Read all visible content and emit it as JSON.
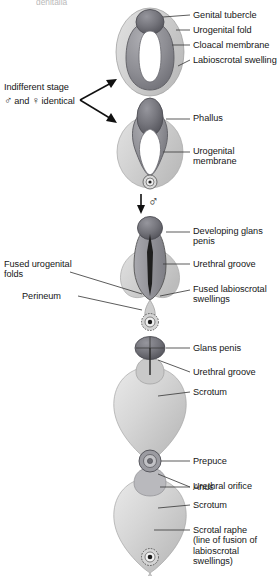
{
  "figure": {
    "title_cut_off": "genitalia",
    "type": "anatomical-development-diagram",
    "indifferent_note": {
      "line1": "Indifferent stage",
      "line2_pre": "",
      "male_symbol": "♂",
      "and": "and",
      "female_symbol": "♀",
      "line2_post": "identical",
      "line2_full": "♂ and ♀ identical"
    },
    "pathway_symbol": "♂",
    "colors": {
      "tubercle": "#6e6e76",
      "fold": "#8e8e93",
      "swelling": "#cfcfcf",
      "membrane": "#ffffff",
      "groove": "#2a2a2a",
      "outline": "#4a4a4a",
      "label_text": "#161616",
      "leader_line": "#4a4a4a"
    }
  },
  "stages": [
    {
      "id": "stage-1-indifferent",
      "name": "Indifferent stage",
      "labels": [
        {
          "key": "genital-tubercle",
          "text": "Genital tubercle",
          "side": "right"
        },
        {
          "key": "urogenital-fold",
          "text": "Urogenital fold",
          "side": "right"
        },
        {
          "key": "cloacal-membrane",
          "text": "Cloacal membrane",
          "side": "right"
        },
        {
          "key": "labioscrotal-swelling",
          "text": "Labioscrotal swelling",
          "side": "right"
        }
      ]
    },
    {
      "id": "stage-2-phallus",
      "name": "Early differentiation",
      "labels": [
        {
          "key": "phallus",
          "text": "Phallus",
          "side": "right"
        },
        {
          "key": "urogenital-membrane",
          "text": "Urogenital\nmembrane",
          "side": "right"
        }
      ]
    },
    {
      "id": "stage-3-developing-glans",
      "name": "Developing glans stage",
      "labels": [
        {
          "key": "developing-glans-penis",
          "text": "Developing glans\npenis",
          "side": "right"
        },
        {
          "key": "urethral-groove",
          "text": "Urethral groove",
          "side": "right"
        },
        {
          "key": "fused-labioscrotal-swellings",
          "text": "Fused labioscrotal\nswellings",
          "side": "right"
        },
        {
          "key": "fused-urogenital-folds",
          "text": "Fused urogenital\nfolds",
          "side": "left"
        },
        {
          "key": "perineum",
          "text": "Perineum",
          "side": "left"
        }
      ]
    },
    {
      "id": "stage-4-glans-penis",
      "name": "Late fetal stage",
      "labels": [
        {
          "key": "glans-penis",
          "text": "Glans penis",
          "side": "right"
        },
        {
          "key": "urethral-groove",
          "text": "Urethral groove",
          "side": "right"
        },
        {
          "key": "scrotum",
          "text": "Scrotum",
          "side": "right"
        },
        {
          "key": "anus",
          "text": "Anus",
          "side": "right"
        }
      ]
    },
    {
      "id": "stage-5-newborn",
      "name": "Newborn",
      "labels": [
        {
          "key": "prepuce",
          "text": "Prepuce",
          "side": "right"
        },
        {
          "key": "urethral-orifice",
          "text": "Urethral orifice",
          "side": "right"
        },
        {
          "key": "scrotum",
          "text": "Scrotum",
          "side": "right"
        },
        {
          "key": "scrotal-raphe",
          "text": "Scrotal raphe\n(line of fusion of\nlabioscrotal\nswellings)",
          "side": "right"
        }
      ]
    }
  ]
}
